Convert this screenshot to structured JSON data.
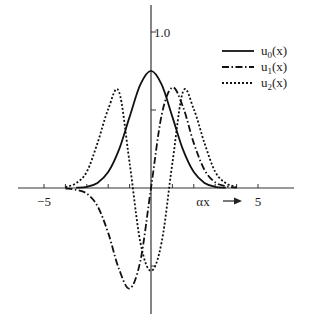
{
  "chart_data": {
    "type": "line",
    "title": "",
    "xlabel": "αx →",
    "ylabel": "",
    "xlim": [
      -6.25,
      6.65
    ],
    "ylim": [
      -0.82,
      1.08
    ],
    "x_ticks": [
      -5,
      -4,
      -3,
      -2,
      -1,
      0,
      1,
      2,
      3,
      4,
      5
    ],
    "x_tick_labels": [
      {
        "x": -5,
        "text": "−5"
      },
      {
        "x": 5,
        "text": "5"
      }
    ],
    "y_ticks": [
      -0.5,
      0.5,
      1.0
    ],
    "y_tick_labels": [
      {
        "y": 1.0,
        "text": "1.0"
      }
    ],
    "grid": false,
    "legend_position": "upper right",
    "series": [
      {
        "name": "u0(x)",
        "label_main": "u",
        "label_sub": "0",
        "label_tail": "(x)",
        "style": "solid",
        "x": [
          -3.5,
          -3,
          -2.5,
          -2,
          -1.5,
          -1,
          -0.5,
          0,
          0.5,
          1,
          1.5,
          2,
          2.5,
          3,
          3.5
        ],
        "values": [
          0.002,
          0.008,
          0.033,
          0.102,
          0.244,
          0.456,
          0.663,
          0.751,
          0.663,
          0.456,
          0.244,
          0.102,
          0.033,
          0.008,
          0.002
        ]
      },
      {
        "name": "u1(x)",
        "label_main": "u",
        "label_sub": "1",
        "label_tail": "(x)",
        "style": "dashdot",
        "x": [
          -4,
          -3.5,
          -3,
          -2.5,
          -2,
          -1.5,
          -1,
          -0.5,
          0,
          0.5,
          1,
          1.5,
          2,
          2.5,
          3,
          3.5,
          4
        ],
        "values": [
          -0.002,
          -0.012,
          -0.036,
          -0.116,
          -0.288,
          -0.518,
          -0.644,
          -0.469,
          0,
          0.469,
          0.644,
          0.518,
          0.288,
          0.116,
          0.036,
          0.012,
          0.002
        ]
      },
      {
        "name": "u2(x)",
        "label_main": "u",
        "label_sub": "2",
        "label_tail": "(x)",
        "style": "dotted",
        "x": [
          -4,
          -3.5,
          -3,
          -2.5,
          -2,
          -1.5,
          -1,
          -0.5,
          0,
          0.5,
          1,
          1.5,
          2,
          2.5,
          3,
          3.5,
          4
        ],
        "values": [
          0.006,
          0.031,
          0.104,
          0.288,
          0.505,
          0.619,
          0.161,
          -0.346,
          -0.531,
          -0.346,
          0.161,
          0.619,
          0.505,
          0.288,
          0.104,
          0.031,
          0.006
        ]
      }
    ]
  },
  "legend": {
    "items": [
      {
        "main": "u",
        "sub": "0",
        "tail": "(x)"
      },
      {
        "main": "u",
        "sub": "1",
        "tail": "(x)"
      },
      {
        "main": "u",
        "sub": "2",
        "tail": "(x)"
      }
    ]
  },
  "axes": {
    "x_label_main": "αx",
    "x_min_label": "−5",
    "x_max_label": "5",
    "y_top_label": "1.0"
  }
}
